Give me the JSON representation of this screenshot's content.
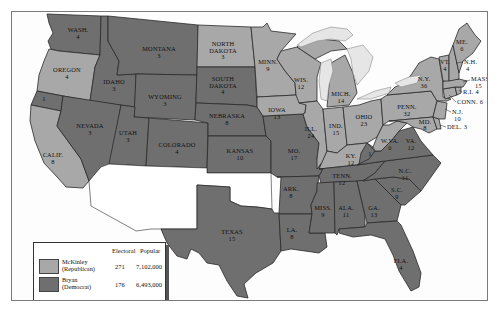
{
  "colors": {
    "republican": "#a8a8a8",
    "democrat": "#6f6f6f",
    "lakes": "#e6e6e6",
    "background": "#fdfdfd"
  },
  "legend": {
    "col_electoral": "Electoral",
    "col_popular": "Popular",
    "entries": [
      {
        "candidate": "McKinley",
        "party": "(Republican)",
        "electoral": "271",
        "popular": "7,102,000",
        "color_key": "republican"
      },
      {
        "candidate": "Bryan",
        "party": "(Democrat)",
        "electoral": "176",
        "popular": "6,493,000",
        "color_key": "democrat"
      }
    ]
  },
  "states": [
    {
      "abbr": "WASH.",
      "votes": "4",
      "winner": "democrat"
    },
    {
      "abbr": "OREGON",
      "votes": "4",
      "winner": "republican"
    },
    {
      "abbr": "CALIF.",
      "votes": "8",
      "winner": "republican",
      "split": {
        "votes": "1",
        "winner": "democrat"
      }
    },
    {
      "abbr": "IDAHO",
      "votes": "3",
      "winner": "democrat"
    },
    {
      "abbr": "NEVADA",
      "votes": "3",
      "winner": "democrat"
    },
    {
      "abbr": "MONTANA",
      "votes": "3",
      "winner": "democrat"
    },
    {
      "abbr": "WYOMING",
      "votes": "3",
      "winner": "democrat"
    },
    {
      "abbr": "UTAH",
      "votes": "3",
      "winner": "democrat"
    },
    {
      "abbr": "COLORADO",
      "votes": "4",
      "winner": "democrat"
    },
    {
      "abbr": "NORTH DAKOTA",
      "votes": "3",
      "winner": "republican"
    },
    {
      "abbr": "SOUTH DAKOTA",
      "votes": "4",
      "winner": "democrat"
    },
    {
      "abbr": "NEBRASKA",
      "votes": "8",
      "winner": "democrat"
    },
    {
      "abbr": "KANSAS",
      "votes": "10",
      "winner": "democrat"
    },
    {
      "abbr": "TEXAS",
      "votes": "15",
      "winner": "democrat"
    },
    {
      "abbr": "MINN.",
      "votes": "9",
      "winner": "republican"
    },
    {
      "abbr": "IOWA",
      "votes": "13",
      "winner": "republican"
    },
    {
      "abbr": "MO.",
      "votes": "17",
      "winner": "democrat"
    },
    {
      "abbr": "ARK.",
      "votes": "8",
      "winner": "democrat"
    },
    {
      "abbr": "LA.",
      "votes": "8",
      "winner": "democrat"
    },
    {
      "abbr": "WIS.",
      "votes": "12",
      "winner": "republican"
    },
    {
      "abbr": "ILL.",
      "votes": "24",
      "winner": "republican"
    },
    {
      "abbr": "MISS.",
      "votes": "9",
      "winner": "democrat"
    },
    {
      "abbr": "MICH.",
      "votes": "14",
      "winner": "republican"
    },
    {
      "abbr": "IND.",
      "votes": "15",
      "winner": "republican"
    },
    {
      "abbr": "KY.",
      "votes": "12",
      "winner": "republican",
      "split": {
        "votes": "1",
        "winner": "democrat"
      }
    },
    {
      "abbr": "TENN.",
      "votes": "12",
      "winner": "democrat"
    },
    {
      "abbr": "ALA.",
      "votes": "11",
      "winner": "democrat"
    },
    {
      "abbr": "OHIO",
      "votes": "23",
      "winner": "republican"
    },
    {
      "abbr": "GA.",
      "votes": "13",
      "winner": "democrat"
    },
    {
      "abbr": "FLA.",
      "votes": "4",
      "winner": "democrat"
    },
    {
      "abbr": "W.VA.",
      "votes": "6",
      "winner": "republican"
    },
    {
      "abbr": "VA.",
      "votes": "12",
      "winner": "democrat"
    },
    {
      "abbr": "N.C.",
      "votes": "11",
      "winner": "democrat"
    },
    {
      "abbr": "S.C.",
      "votes": "9",
      "winner": "democrat"
    },
    {
      "abbr": "PENN.",
      "votes": "32",
      "winner": "republican"
    },
    {
      "abbr": "N.Y.",
      "votes": "36",
      "winner": "republican"
    },
    {
      "abbr": "MD.",
      "votes": "8",
      "winner": "republican"
    },
    {
      "abbr": "DEL.",
      "votes": "3",
      "winner": "republican"
    },
    {
      "abbr": "N.J.",
      "votes": "10",
      "winner": "republican"
    },
    {
      "abbr": "CONN.",
      "votes": "6",
      "winner": "republican"
    },
    {
      "abbr": "R.I.",
      "votes": "4",
      "winner": "republican"
    },
    {
      "abbr": "MASS.",
      "votes": "15",
      "winner": "republican"
    },
    {
      "abbr": "VT.",
      "votes": "4",
      "winner": "republican"
    },
    {
      "abbr": "N.H.",
      "votes": "4",
      "winner": "republican"
    },
    {
      "abbr": "ME.",
      "votes": "6",
      "winner": "republican"
    }
  ],
  "unshaded_territories": [
    "Arizona Territory",
    "New Mexico Territory",
    "Oklahoma Territory / Indian Territory"
  ]
}
